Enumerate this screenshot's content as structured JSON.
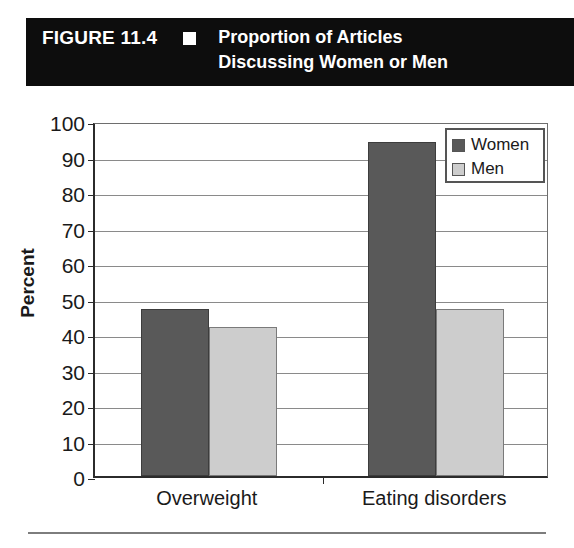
{
  "banner": {
    "figure_number": "FIGURE 11.4",
    "marker_icon": "white-square-icon",
    "title": "Proportion of Articles\nDiscussing Women or Men",
    "background_color": "#0d0d0d",
    "text_color": "#ffffff"
  },
  "chart_data": {
    "type": "bar",
    "title": "Proportion of Articles Discussing Women or Men",
    "categories": [
      "Overweight",
      "Eating disorders"
    ],
    "series": [
      {
        "name": "Women",
        "values": [
          47,
          94
        ],
        "color": "#595959"
      },
      {
        "name": "Men",
        "values": [
          42,
          47
        ],
        "color": "#cdcdcd"
      }
    ],
    "xlabel": "",
    "ylabel": "Percent",
    "ylim": [
      0,
      100
    ],
    "ytick_step": 10,
    "yticks": [
      "100",
      "90",
      "80",
      "70",
      "60",
      "50",
      "40",
      "30",
      "20",
      "10",
      "0"
    ],
    "grid": true,
    "legend_position": "top-right"
  },
  "legend": {
    "items": [
      {
        "label": "Women",
        "swatch": "dark-gray-swatch-icon"
      },
      {
        "label": "Men",
        "swatch": "light-gray-swatch-icon"
      }
    ]
  },
  "axis": {
    "y_title": "Percent"
  }
}
